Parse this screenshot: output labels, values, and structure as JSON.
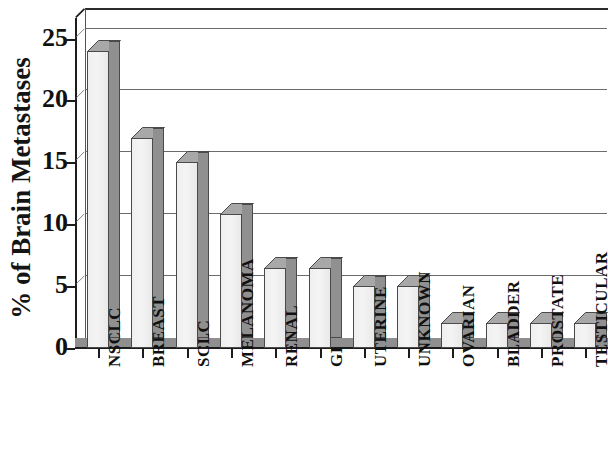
{
  "chart_data": {
    "type": "bar",
    "title": "",
    "subtitle": "",
    "xlabel": "",
    "ylabel": "% of Brain Metastases",
    "ylim": [
      0,
      26.5
    ],
    "yticks": [
      0,
      5,
      10,
      15,
      20,
      25
    ],
    "ytick_labels": [
      "0",
      "5",
      "10",
      "15",
      "20",
      "25"
    ],
    "grid": true,
    "gridlines_at": [
      5,
      10,
      15,
      20,
      25
    ],
    "legend": null,
    "legend_position": "none",
    "style": "3d-bar",
    "categories": [
      "NSCLC",
      "BREAST",
      "SCLC",
      "MELANOMA",
      "RENAL",
      "GI",
      "UTERINE",
      "UNKNOWN",
      "OVARIAN",
      "BLADDER",
      "PROSTATE",
      "TESTICULAR"
    ],
    "values": [
      24.0,
      17.0,
      15.0,
      10.8,
      6.5,
      6.5,
      5.0,
      5.0,
      2.0,
      2.0,
      2.0,
      2.0
    ],
    "series": [
      {
        "name": "% of Brain Metastases",
        "values": [
          24.0,
          17.0,
          15.0,
          10.8,
          6.5,
          6.5,
          5.0,
          5.0,
          2.0,
          2.0,
          2.0,
          2.0
        ]
      }
    ],
    "annotations": []
  },
  "colors": {
    "bar_face": "#f1f1f1",
    "bar_side": "#909090",
    "bar_top": "#a8a8a8",
    "bar_outline": "#4a4a4a",
    "axis": "#1c1c1c",
    "gridline": "#6b6b6b",
    "floor": "#8f8f8f",
    "background": "#ffffff",
    "text": "#111111"
  }
}
